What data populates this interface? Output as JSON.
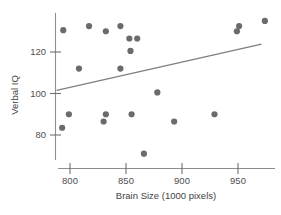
{
  "chart_data": {
    "type": "scatter",
    "title": "",
    "xlabel": "Brain Size (1000 pixels)",
    "ylabel": "Verbal IQ",
    "xticks": [
      800,
      850,
      900,
      950
    ],
    "xtick_labels": [
      "800",
      "850",
      "900",
      "950"
    ],
    "yticks": [
      80,
      100,
      120
    ],
    "ytick_labels": [
      "80",
      "100",
      "120"
    ],
    "xlim": [
      789,
      976
    ],
    "ylim": [
      69,
      136
    ],
    "grid": false,
    "legend": null,
    "marker": {
      "shape": "circle",
      "color": "#6b6b6b",
      "size": 3.1
    },
    "trendline": {
      "type": "linear-fit",
      "color": "#7e7e7e",
      "x_start": 788,
      "y_start": 101.5,
      "x_end": 971,
      "y_end": 123.8
    },
    "points": [
      {
        "x": 794,
        "y": 130.5
      },
      {
        "x": 817,
        "y": 132.5
      },
      {
        "x": 832,
        "y": 130.0
      },
      {
        "x": 845,
        "y": 132.5
      },
      {
        "x": 853,
        "y": 126.5
      },
      {
        "x": 860,
        "y": 126.5
      },
      {
        "x": 854,
        "y": 120.5
      },
      {
        "x": 808,
        "y": 112.0
      },
      {
        "x": 845,
        "y": 112.0
      },
      {
        "x": 878,
        "y": 100.5
      },
      {
        "x": 799,
        "y": 90.0
      },
      {
        "x": 832,
        "y": 90.0
      },
      {
        "x": 855,
        "y": 90.0
      },
      {
        "x": 929,
        "y": 90.0
      },
      {
        "x": 830,
        "y": 86.5
      },
      {
        "x": 893,
        "y": 86.5
      },
      {
        "x": 793,
        "y": 83.5
      },
      {
        "x": 866,
        "y": 71.0
      },
      {
        "x": 949,
        "y": 130.0
      },
      {
        "x": 951,
        "y": 132.5
      },
      {
        "x": 974,
        "y": 135.0
      }
    ]
  }
}
